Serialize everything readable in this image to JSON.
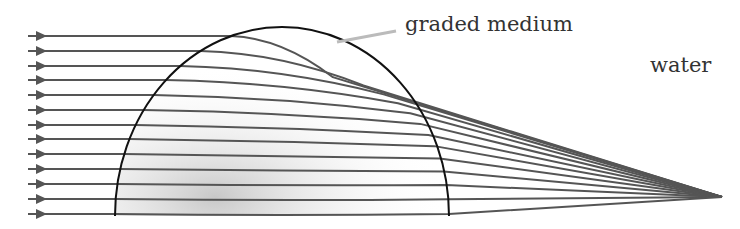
{
  "labels": {
    "medium": "graded medium",
    "water": "water"
  },
  "colors": {
    "ray": "#555555",
    "boundary": "#111111",
    "pointer": "#bbbbbb"
  },
  "lens": {
    "cx": 282,
    "base_y": 216,
    "rx": 167,
    "ry": 189
  },
  "focus": {
    "x": 722,
    "y": 197
  },
  "ray_start_x": 28,
  "ray_ys": [
    36,
    51,
    66,
    80,
    95,
    110,
    125,
    139,
    154,
    169,
    184,
    199,
    214
  ]
}
